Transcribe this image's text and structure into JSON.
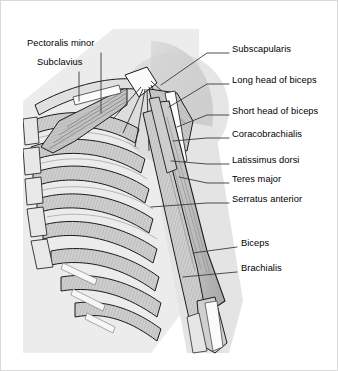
{
  "figure": {
    "background_color": "#ffffff",
    "ink_color": "#000000",
    "border_color": "#d9d9d9",
    "width": 338,
    "height": 371
  },
  "palette": {
    "skin_silhouette": "#ececec",
    "shoulder_shadow": "#c9c9c9",
    "muscle_light": "#d8d8d8",
    "muscle_mid": "#bdbdbd",
    "muscle_dark": "#9e9e9e",
    "bone_white": "#fdfdfd",
    "outline": "#1a1a1a",
    "leader_line": "#3a3a3a"
  },
  "labels": {
    "left": [
      {
        "id": "pectoralis-minor",
        "text": "Pectoralis minor",
        "x": 26,
        "y": 45
      },
      {
        "id": "subclavius",
        "text": "Subclavius",
        "x": 36,
        "y": 64
      }
    ],
    "right": [
      {
        "id": "subscapularis",
        "text": "Subscapularis",
        "x": 231,
        "y": 49
      },
      {
        "id": "long-head-of-biceps",
        "text": "Long head of biceps",
        "x": 231,
        "y": 80
      },
      {
        "id": "short-head-of-biceps",
        "text": "Short head of biceps",
        "x": 231,
        "y": 111
      },
      {
        "id": "coracobrachialis",
        "text": "Coracobrachialis",
        "x": 231,
        "y": 134
      },
      {
        "id": "latissimus-dorsi",
        "text": "Latissimus dorsi",
        "x": 231,
        "y": 160
      },
      {
        "id": "teres-major",
        "text": "Teres major",
        "x": 231,
        "y": 179
      },
      {
        "id": "serratus-anterior",
        "text": "Serratus anterior",
        "x": 231,
        "y": 199
      },
      {
        "id": "biceps",
        "text": "Biceps",
        "x": 240,
        "y": 243
      },
      {
        "id": "brachialis",
        "text": "Brachialis",
        "x": 240,
        "y": 268
      }
    ]
  }
}
